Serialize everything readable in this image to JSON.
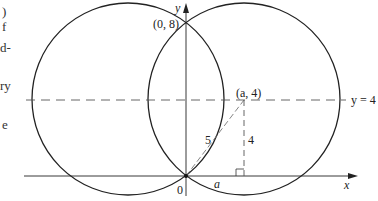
{
  "margin_text_fragments": [
    ")",
    "f",
    "d-",
    "ry",
    "e"
  ],
  "diagram": {
    "labels": {
      "y_axis": "y",
      "x_axis": "x",
      "origin": "0",
      "top_intersection": "(0, 8)",
      "point": "(a, 4)",
      "line": "y = 4",
      "hypotenuse": "5",
      "height": "4",
      "base": "a"
    },
    "circles": [
      {
        "center": [
          -3,
          4
        ],
        "radius": 5
      },
      {
        "center": [
          3,
          4
        ],
        "radius": 5
      }
    ],
    "colors": {
      "stroke": "#222222",
      "dashed": "#555555"
    }
  }
}
